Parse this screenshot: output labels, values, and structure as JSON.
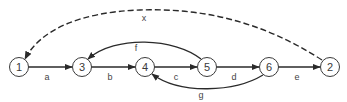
{
  "diagram": {
    "type": "directed-graph",
    "nodes": [
      {
        "id": "1",
        "label": "1",
        "x": 19,
        "y": 67
      },
      {
        "id": "3",
        "label": "3",
        "x": 82,
        "y": 67
      },
      {
        "id": "4",
        "label": "4",
        "x": 145,
        "y": 67
      },
      {
        "id": "5",
        "label": "5",
        "x": 207,
        "y": 67
      },
      {
        "id": "6",
        "label": "6",
        "x": 269,
        "y": 67
      },
      {
        "id": "2",
        "label": "2",
        "x": 330,
        "y": 67
      }
    ],
    "edges": [
      {
        "id": "a",
        "label": "a",
        "from": "1",
        "to": "3",
        "style": "solid"
      },
      {
        "id": "b",
        "label": "b",
        "from": "3",
        "to": "4",
        "style": "solid"
      },
      {
        "id": "c",
        "label": "c",
        "from": "4",
        "to": "5",
        "style": "solid"
      },
      {
        "id": "d",
        "label": "d",
        "from": "5",
        "to": "6",
        "style": "solid"
      },
      {
        "id": "e",
        "label": "e",
        "from": "6",
        "to": "2",
        "style": "solid"
      },
      {
        "id": "f",
        "label": "f",
        "from": "5",
        "to": "3",
        "style": "solid-curved-above"
      },
      {
        "id": "g",
        "label": "g",
        "from": "6",
        "to": "4",
        "style": "solid-curved-below"
      },
      {
        "id": "x",
        "label": "x",
        "from": "2",
        "to": "1",
        "style": "dashed-curved-above"
      }
    ],
    "colors": {
      "stroke": "#2a2a2a",
      "background": "#ffffff"
    }
  }
}
